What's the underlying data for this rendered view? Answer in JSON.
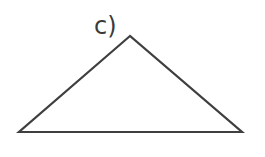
{
  "figure": {
    "label": "c)",
    "shape": "triangle",
    "vertices": [
      [
        130,
        36
      ],
      [
        19,
        132
      ],
      [
        242,
        132
      ]
    ],
    "stroke_color": "#3f3f3f",
    "fill_color": "#ffffff"
  }
}
